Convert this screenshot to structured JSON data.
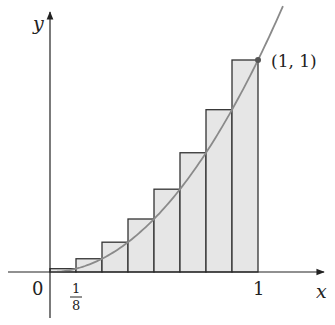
{
  "figure": {
    "title": "",
    "axes": {
      "x_label": "x",
      "y_label": "y",
      "origin_label": "0",
      "x_ticks": [
        {
          "label_num": "1",
          "label_den": "8",
          "value": 0.125
        },
        {
          "label": "1",
          "value": 1
        }
      ]
    },
    "curve": {
      "function": "y = x^2",
      "domain": [
        0,
        1.12
      ],
      "color": "#8a8a8a"
    },
    "point": {
      "label": "(1, 1)",
      "x": 1,
      "y": 1
    },
    "rectangles": {
      "count": 8,
      "width": 0.125,
      "method": "right-endpoint",
      "fill": "#e6e6e6",
      "stroke": "#333333",
      "heights": [
        0.015625,
        0.0625,
        0.140625,
        0.25,
        0.390625,
        0.5625,
        0.765625,
        1.0
      ]
    }
  }
}
